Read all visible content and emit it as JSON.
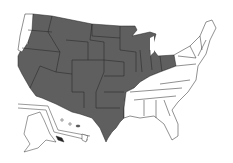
{
  "map": {
    "title": "United States",
    "colors": {
      "shaded": "#5f5f5f",
      "unshaded": "#ffffff",
      "border": "#222222"
    },
    "shaded_states": [
      "WA-east",
      "ID",
      "MT",
      "WY",
      "ND",
      "SD",
      "NE",
      "KS",
      "OK",
      "TX",
      "NM",
      "AZ",
      "UT",
      "CO",
      "NV",
      "CA",
      "OR",
      "MN",
      "WI",
      "MI",
      "IA",
      "MO",
      "AR",
      "IL",
      "IN",
      "OH",
      "HI-partial"
    ],
    "unshaded_states": [
      "WA-coast",
      "LA",
      "MS",
      "AL",
      "GA",
      "FL",
      "SC",
      "NC",
      "TN",
      "KY",
      "VA",
      "WV",
      "PA",
      "NY",
      "VT",
      "NH",
      "ME",
      "MA",
      "CT",
      "RI",
      "NJ",
      "DE",
      "MD",
      "AK"
    ]
  }
}
